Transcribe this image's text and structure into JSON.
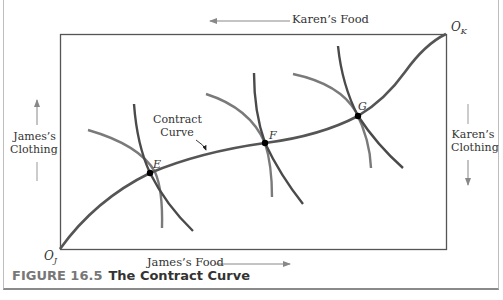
{
  "figure": {
    "number_label": "FIGURE 16.5",
    "title": "The Contract Curve"
  },
  "axes": {
    "top_label": "Karen’s Food",
    "bottom_label": "James’s Food",
    "left_label_line1": "James’s",
    "left_label_line2": "Clothing",
    "right_label_line1": "Karen’s",
    "right_label_line2": "Clothing"
  },
  "origins": {
    "james": "O",
    "james_sub": "J",
    "karen": "O",
    "karen_sub": "K"
  },
  "curve_label_line1": "Contract",
  "curve_label_line2": "Curve",
  "points": [
    {
      "label": "E",
      "x": 150,
      "y": 173
    },
    {
      "label": "F",
      "x": 265,
      "y": 143
    },
    {
      "label": "G",
      "x": 358,
      "y": 116
    }
  ],
  "colors": {
    "curve": "#555555",
    "indifference_james": "#4a4a4a",
    "indifference_karen": "#7a7a7a",
    "box": "#555555",
    "arrow": "#888888"
  }
}
